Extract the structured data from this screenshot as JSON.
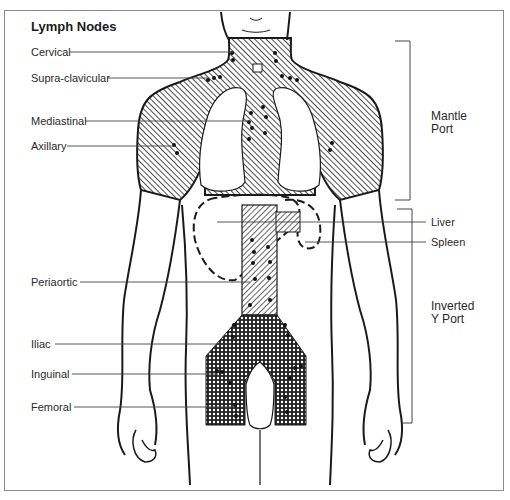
{
  "diagram": {
    "title": "Lymph Nodes",
    "left_labels": [
      {
        "id": "cervical",
        "text": "Cervical"
      },
      {
        "id": "supraclavicular",
        "text": "Supra-clavicular"
      },
      {
        "id": "mediastinal",
        "text": "Mediastinal"
      },
      {
        "id": "axillary",
        "text": "Axillary"
      },
      {
        "id": "periaortic",
        "text": "Periaortic"
      },
      {
        "id": "iliac",
        "text": "Iliac"
      },
      {
        "id": "inguinal",
        "text": "Inguinal"
      },
      {
        "id": "femoral",
        "text": "Femoral"
      }
    ],
    "right_labels": [
      {
        "id": "liver",
        "text": "Liver"
      },
      {
        "id": "spleen",
        "text": "Spleen"
      }
    ],
    "ports": [
      {
        "id": "mantle",
        "line1": "Mantle",
        "line2": "Port"
      },
      {
        "id": "inverted-y",
        "line1": "Inverted",
        "line2": "Y Port"
      }
    ],
    "colors": {
      "line": "#1a1a1a",
      "leader": "#555555",
      "frame": "#8a8a8a",
      "background": "#ffffff"
    }
  }
}
